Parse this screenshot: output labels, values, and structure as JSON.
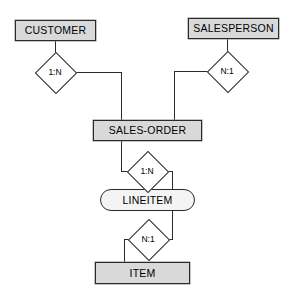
{
  "diagram": {
    "kind": "entity-relationship-diagram",
    "notation": "cardinality-ratio-diamond",
    "background_color": "#ffffff",
    "line_color": "#2b2b2b",
    "entity_fill": "#d9d9d9",
    "weak_entity_fill": "#f4f4f4",
    "relationship_fill": "#ffffff",
    "entities": [
      {
        "id": "customer",
        "label": "CUSTOMER",
        "shape": "rectangle",
        "fill": "#d9d9d9",
        "x": 15,
        "y": 20,
        "width": 81,
        "height": 21
      },
      {
        "id": "salesperson",
        "label": "SALESPERSON",
        "shape": "rectangle",
        "fill": "#d9d9d9",
        "x": 188,
        "y": 18,
        "width": 91,
        "height": 21
      },
      {
        "id": "sales-order",
        "label": "SALES-ORDER",
        "shape": "rectangle",
        "fill": "#d9d9d9",
        "x": 93,
        "y": 120,
        "width": 109,
        "height": 21
      },
      {
        "id": "lineitem",
        "label": "LINEITEM",
        "shape": "rounded-rectangle",
        "fill": "#f4f4f4",
        "x": 100,
        "y": 189,
        "width": 95,
        "height": 22
      },
      {
        "id": "item",
        "label": "ITEM",
        "shape": "rectangle",
        "fill": "#d9d9d9",
        "x": 95,
        "y": 262,
        "width": 95,
        "height": 22
      }
    ],
    "relationships": [
      {
        "id": "customer-sales-order",
        "label": "1:N",
        "from": "customer",
        "to": "sales-order",
        "x": 36,
        "y": 53
      },
      {
        "id": "sales-order-salesperson",
        "label": "N:1",
        "from": "sales-order",
        "to": "salesperson",
        "x": 208,
        "y": 52
      },
      {
        "id": "sales-order-lineitem",
        "label": "1:N",
        "from": "sales-order",
        "to": "lineitem",
        "x": 128,
        "y": 152
      },
      {
        "id": "lineitem-item",
        "label": "N:1",
        "from": "lineitem",
        "to": "item",
        "x": 129,
        "y": 220
      }
    ],
    "edges": [
      {
        "id": "edge-customer-to-rel1",
        "points": "55,41 55,57"
      },
      {
        "id": "edge-rel1-to-sales-order",
        "points": "69,72 121,72 121,120"
      },
      {
        "id": "edge-salesperson-to-rel2",
        "points": "227,39 227,56"
      },
      {
        "id": "edge-rel2-to-sales-order",
        "points": "208,71 174,71 174,120"
      },
      {
        "id": "edge-sales-order-to-rel3",
        "points": "121,141 121,171 128,171"
      },
      {
        "id": "edge-rel3-to-lineitem",
        "points": "162,171 172,171 172,189"
      },
      {
        "id": "edge-lineitem-to-rel4",
        "points": "172,211 172,239 163,239"
      },
      {
        "id": "edge-rel4-to-item",
        "points": "129,239 124,239 124,262"
      }
    ]
  }
}
